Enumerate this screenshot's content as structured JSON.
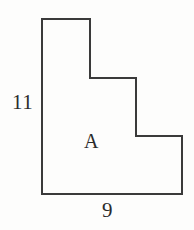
{
  "figure": {
    "kind": "staircase-polygon",
    "region_label": "A",
    "stroke_color": "#3a3a3a",
    "fill_color": "#fdfdfc",
    "background_color": "#fdfdfc",
    "stroke_width": 2,
    "vertices": [
      {
        "x": 42,
        "y": 19
      },
      {
        "x": 90,
        "y": 19
      },
      {
        "x": 90,
        "y": 78
      },
      {
        "x": 136,
        "y": 78
      },
      {
        "x": 136,
        "y": 136
      },
      {
        "x": 182,
        "y": 136
      },
      {
        "x": 182,
        "y": 194
      },
      {
        "x": 42,
        "y": 194
      }
    ],
    "points_attr": "42,19 90,19 90,78 136,78 136,136 182,136 182,194 42,194"
  },
  "labels": {
    "left_side": "11",
    "interior": "A",
    "bottom_side": "9"
  }
}
